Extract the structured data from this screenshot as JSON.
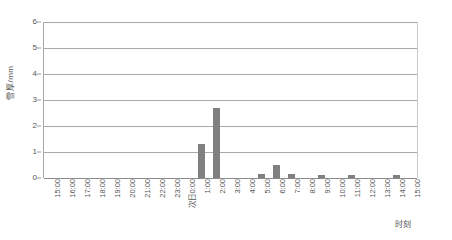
{
  "chart_data": {
    "type": "bar",
    "title": "",
    "xlabel": "时刻",
    "ylabel": "雪厚/mm",
    "ylim": [
      0,
      6
    ],
    "yticks": [
      0,
      1,
      2,
      3,
      4,
      5,
      6
    ],
    "grid": true,
    "legend": "none",
    "bar_color": "#808080",
    "categories": [
      "15:00",
      "16:00",
      "17:00",
      "18:00",
      "19:00",
      "20:00",
      "21:00",
      "22:00",
      "23:00",
      "次日0:00",
      "1:00",
      "2:00",
      "3:00",
      "4:00",
      "5:00",
      "6:00",
      "7:00",
      "8:00",
      "9:00",
      "10:00",
      "11:00",
      "12:00",
      "13:00",
      "14:00",
      "15:00"
    ],
    "values": [
      0,
      0,
      0,
      0,
      0,
      0,
      0,
      0,
      0,
      0,
      1.3,
      2.7,
      0,
      0,
      0.15,
      0.5,
      0.15,
      0,
      0.12,
      0,
      0.12,
      0,
      0,
      0.12,
      0
    ]
  },
  "axes": {
    "y_title": "雪厚/mm",
    "x_title": "时刻"
  }
}
